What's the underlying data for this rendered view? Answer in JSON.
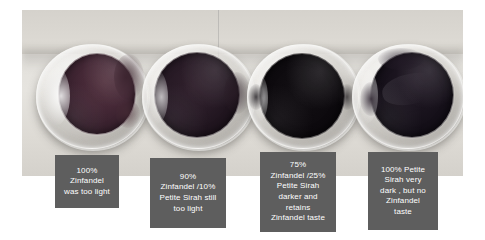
{
  "page": {
    "background_color": "#ffffff",
    "type": "photograph-with-text-labels"
  },
  "photo": {
    "name": "wine-glasses-photo",
    "surface_color": "#e2e0db",
    "backdrop_color": "#d5d2cc"
  },
  "glasses": [
    {
      "id": "glass-1",
      "wine_color": "#3a2430",
      "description": "lightest wine, translucent, large bright rim reflection"
    },
    {
      "id": "glass-2",
      "wine_color": "#241620",
      "description": "darker wine, mostly opaque with faint reflections"
    },
    {
      "id": "glass-3",
      "wine_color": "#0d0a0e",
      "description": "very dark, nearly black, flat matte surface"
    },
    {
      "id": "glass-4",
      "wine_color": "#16111a",
      "description": "very dark with angular highlight across upper left"
    }
  ],
  "captions": [
    {
      "id": "caption-1",
      "box_color": "#5e5e5e",
      "text_color": "#ffffff",
      "lines": [
        "100%",
        "Zinfandel",
        "was too light"
      ]
    },
    {
      "id": "caption-2",
      "box_color": "#5e5e5e",
      "text_color": "#ffffff",
      "lines": [
        "90%",
        "Zinfandel /10%",
        "Petite Sirah still",
        "too light"
      ]
    },
    {
      "id": "caption-3",
      "box_color": "#5e5e5e",
      "text_color": "#ffffff",
      "lines": [
        "75%",
        "Zinfandel /25%",
        "Petite Sirah",
        "darker and",
        "retains",
        "Zinfandel taste"
      ]
    },
    {
      "id": "caption-4",
      "box_color": "#5e5e5e",
      "text_color": "#ffffff",
      "lines": [
        "100% Petite",
        "Sirah very",
        "dark , but no",
        "Zinfandel",
        "taste"
      ]
    }
  ]
}
